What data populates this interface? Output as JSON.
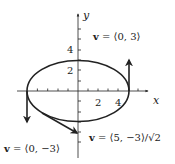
{
  "diagram": {
    "type": "parametric-ellipse-velocity",
    "axes": {
      "x_label": "x",
      "y_label": "y",
      "x_ticks": [
        "2",
        "4"
      ],
      "y_ticks": [
        "2",
        "4"
      ]
    },
    "curve": "ellipse with semi-axes 5 (x) and 3 (y) centered at origin",
    "annotations": [
      {
        "id": "top",
        "vec": "v",
        "text": " = ⟨0, 3⟩"
      },
      {
        "id": "bottom-right",
        "vec": "v",
        "text": " = ⟨5, −3⟩/√2"
      },
      {
        "id": "bottom-left",
        "vec": "v",
        "text": " = ⟨0, −3⟩"
      }
    ],
    "colors": {
      "ink": "#222222",
      "background": "#ffffff"
    }
  }
}
